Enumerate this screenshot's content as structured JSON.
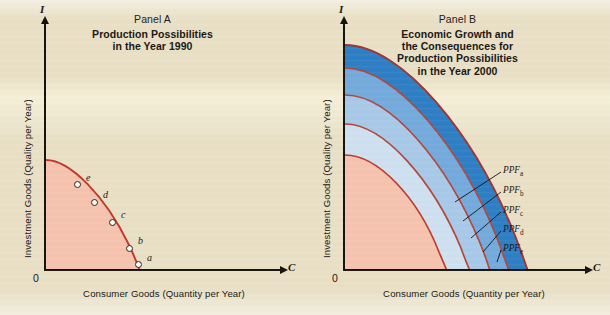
{
  "figure": {
    "background_color": "#e9e0c6",
    "curve_color": "#c0392b"
  },
  "panel_a": {
    "label": "Panel A",
    "title_line1": "Production Possibilities",
    "title_line2": "in the Year 1990",
    "y_axis_letter": "I",
    "x_axis_letter": "C",
    "origin": "0",
    "y_axis_label": "Investment Goods (Quality per Year)",
    "x_axis_label": "Consumer Goods (Quantity per Year)",
    "fill_color": "#f6c3ae",
    "points": [
      {
        "label": "e",
        "x": 0.205,
        "y": 0.735
      },
      {
        "label": "d",
        "x": 0.33,
        "y": 0.64
      },
      {
        "label": "c",
        "x": 0.47,
        "y": 0.52
      },
      {
        "label": "b",
        "x": 0.66,
        "y": 0.3
      },
      {
        "label": "a",
        "x": 0.8,
        "y": 0.135
      }
    ]
  },
  "panel_b": {
    "label": "Panel B",
    "title_line1": "Economic Growth and",
    "title_line2": "the Consequences for",
    "title_line3": "Production Possibilities",
    "title_line4": "in the Year 2000",
    "y_axis_letter": "I",
    "x_axis_letter": "C",
    "origin": "0",
    "y_axis_label": "Investment Goods (Quality per Year)",
    "x_axis_label": "Consumer Goods (Quantity per Year)",
    "curves": [
      {
        "label": "PPF",
        "subscript": "a",
        "fill_color": "#f6c3ae"
      },
      {
        "label": "PPF",
        "subscript": "b",
        "fill_color": "#cfe0f0"
      },
      {
        "label": "PPF",
        "subscript": "c",
        "fill_color": "#a8c9e8"
      },
      {
        "label": "PPF",
        "subscript": "d",
        "fill_color": "#74aadd"
      },
      {
        "label": "PPF",
        "subscript": "e",
        "fill_color": "#2f7fc6"
      }
    ]
  }
}
